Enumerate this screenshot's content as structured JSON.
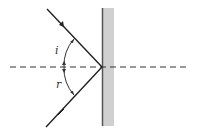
{
  "diagram": {
    "labels": {
      "incidence_angle": "i",
      "reflection_angle": "r"
    },
    "colors": {
      "ray": "#222222",
      "mirror_fill": "#d0d0d0",
      "mirror_edge": "#555555",
      "normal": "#333333"
    }
  }
}
